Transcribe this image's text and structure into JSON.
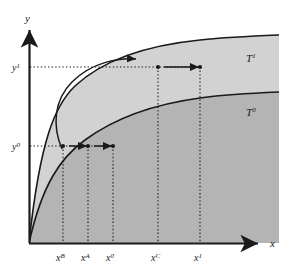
{
  "figure": {
    "background_color": "#ffffff",
    "axes": {
      "x_label": "x",
      "y_label": "y",
      "line_color": "#1a1a1a",
      "origin": {
        "x": 29,
        "y": 243
      }
    },
    "curves": [
      {
        "id": "T1",
        "label_base": "T",
        "label_sup": "1",
        "label_x": 246,
        "label_y": 62,
        "fill_color": "#d2d2d2",
        "stroke_color": "#1a1a1a",
        "description": "upper technology frontier"
      },
      {
        "id": "T0",
        "label_base": "T",
        "label_sup": "0",
        "label_x": 246,
        "label_y": 116,
        "fill_color": "#b4b4b4",
        "stroke_color": "#1a1a1a",
        "description": "lower technology frontier"
      }
    ],
    "y_ticks": [
      {
        "base": "y",
        "sup": "1",
        "value_px": 67,
        "label_x": 12,
        "label_y": 71
      },
      {
        "base": "y",
        "sup": "0",
        "value_px": 146,
        "label_x": 12,
        "label_y": 150
      }
    ],
    "x_ticks": [
      {
        "base": "x",
        "sup": "B",
        "px": 63,
        "label_x": 56,
        "label_y": 261
      },
      {
        "base": "x",
        "sup": "A",
        "px": 88,
        "label_x": 81,
        "label_y": 261
      },
      {
        "base": "x",
        "sup": "0",
        "px": 113,
        "label_x": 106,
        "label_y": 261
      },
      {
        "base": "x",
        "sup": "C",
        "px": 158,
        "label_x": 151,
        "label_y": 261
      },
      {
        "base": "x",
        "sup": "1",
        "px": 200,
        "label_x": 194,
        "label_y": 261
      }
    ],
    "points": [
      {
        "name": "point-xC-on-T1",
        "x": 158,
        "y": 67
      },
      {
        "name": "point-x1-on-T1",
        "x": 200,
        "y": 67
      },
      {
        "name": "point-xB-on-T1",
        "x": 63,
        "y": 146
      },
      {
        "name": "point-xA-on-T0",
        "x": 88,
        "y": 146
      },
      {
        "name": "point-x0-on-T0",
        "x": 113,
        "y": 146
      }
    ],
    "arrows": [
      {
        "name": "arrow-x1-to-xC",
        "from_x": 200,
        "to_x": 160,
        "y": 67,
        "direction": "left"
      },
      {
        "name": "arrow-x0-to-xA",
        "from_x": 113,
        "to_x": 90,
        "y": 146,
        "direction": "left"
      },
      {
        "name": "arrow-xA-to-xB",
        "from_x": 88,
        "to_x": 65,
        "y": 146,
        "direction": "left"
      },
      {
        "name": "arrow-curved-shift",
        "description": "curved arrow from y0 level up to y1 level",
        "direction": "up-right"
      }
    ],
    "dotted_lines": {
      "color": "#1a1a1a",
      "style": "dotted"
    }
  }
}
